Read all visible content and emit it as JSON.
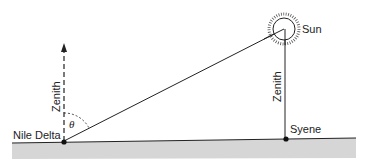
{
  "diagram": {
    "labels": {
      "sun": "Sun",
      "zenith_left": "Zenith",
      "zenith_right": "Zenith",
      "nile_delta": "Nile Delta",
      "syene": "Syene",
      "angle": "θ"
    },
    "colors": {
      "line": "#222222",
      "ground": "#d4d4d4"
    }
  }
}
